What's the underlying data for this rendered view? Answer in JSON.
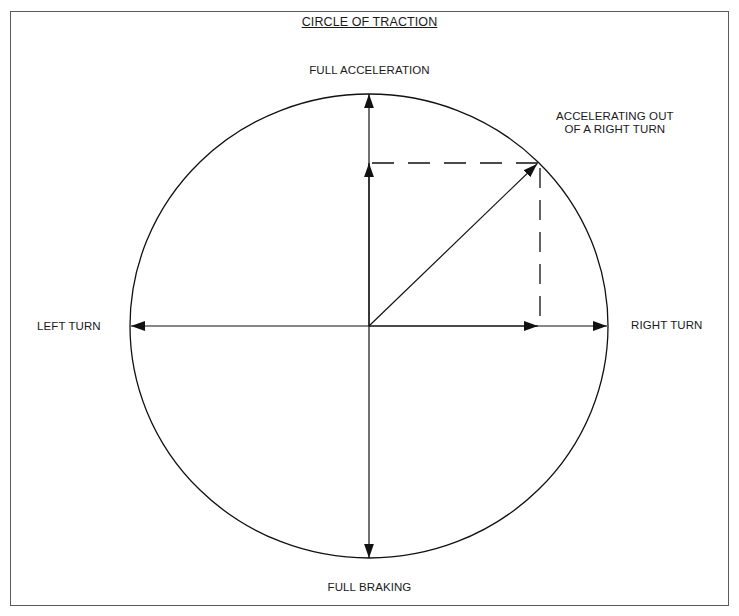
{
  "diagram": {
    "title": "CIRCLE OF TRACTION",
    "labels": {
      "top": "FULL ACCELERATION",
      "bottom": "FULL BRAKING",
      "left": "LEFT TURN",
      "right": "RIGHT TURN",
      "combined_line1": "ACCELERATING OUT",
      "combined_line2": "OF A RIGHT TURN"
    },
    "geometry": {
      "center": [
        369,
        326
      ],
      "radius_x": 239,
      "radius_y": 232,
      "combined_point": [
        538,
        163
      ]
    },
    "colors": {
      "line": "#111111",
      "frame": "#5a5a5a",
      "background": "#ffffff"
    }
  }
}
